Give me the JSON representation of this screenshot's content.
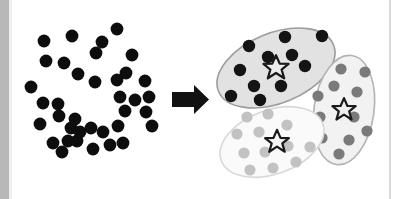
{
  "figure": {
    "title": "Clustering illustration: unlabeled point cloud transformed into three labeled clusters with centroids",
    "width": 397,
    "height": 199,
    "background_color": "#ffffff"
  },
  "chart_data": {
    "type": "scatter",
    "title": "Clustering illustration: unlabeled point cloud transformed into three labeled clusters with centroids",
    "subtitle": "",
    "xlabel": "",
    "ylabel": "",
    "xlim": [
      0,
      397
    ],
    "ylim": [
      0,
      199
    ],
    "grid": false,
    "legend_position": "none",
    "annotations": [
      {
        "name": "transformation-arrow",
        "text": "",
        "shape": "right-arrow",
        "color": "#111111",
        "x": 172,
        "y": 99
      }
    ],
    "series": [
      {
        "name": "Unlabeled points",
        "marker": "circle",
        "color": "#0d0d0d",
        "marker_size": 6.4,
        "points": [
          [
            44,
            41
          ],
          [
            72,
            36
          ],
          [
            46,
            61
          ],
          [
            64,
            63
          ],
          [
            78,
            74
          ],
          [
            96,
            53
          ],
          [
            95,
            82
          ],
          [
            31,
            87
          ],
          [
            117,
            29
          ],
          [
            102,
            42
          ],
          [
            132,
            55
          ],
          [
            126,
            73
          ],
          [
            117,
            80
          ],
          [
            145,
            81
          ],
          [
            43,
            103
          ],
          [
            58,
            104
          ],
          [
            59,
            116
          ],
          [
            75,
            119
          ],
          [
            40,
            124
          ],
          [
            71,
            128
          ],
          [
            80,
            132
          ],
          [
            91,
            128
          ],
          [
            53,
            143
          ],
          [
            68,
            141
          ],
          [
            77,
            141
          ],
          [
            93,
            149
          ],
          [
            62,
            152
          ],
          [
            120,
            97
          ],
          [
            135,
            100
          ],
          [
            149,
            97
          ],
          [
            125,
            111
          ],
          [
            146,
            112
          ],
          [
            118,
            126
          ],
          [
            103,
            132
          ],
          [
            110,
            145
          ],
          [
            123,
            143
          ],
          [
            152,
            126
          ]
        ]
      },
      {
        "name": "Cluster 1 points",
        "marker": "circle",
        "color": "#141414",
        "marker_size": 6.2,
        "points": [
          [
            249,
            46
          ],
          [
            285,
            37
          ],
          [
            322,
            36
          ],
          [
            240,
            70
          ],
          [
            268,
            57
          ],
          [
            292,
            55
          ],
          [
            305,
            66
          ],
          [
            254,
            86
          ],
          [
            281,
            86
          ],
          [
            231,
            96
          ],
          [
            260,
            100
          ]
        ]
      },
      {
        "name": "Cluster 2 points",
        "marker": "circle",
        "color": "#7a7a7a",
        "marker_size": 5.6,
        "points": [
          [
            341,
            69
          ],
          [
            334,
            86
          ],
          [
            318,
            96
          ],
          [
            357,
            92
          ],
          [
            320,
            117
          ],
          [
            354,
            117
          ],
          [
            322,
            138
          ],
          [
            349,
            140
          ],
          [
            339,
            154
          ],
          [
            365,
            72
          ],
          [
            367,
            131
          ]
        ]
      },
      {
        "name": "Cluster 3 points",
        "marker": "circle",
        "color": "#c2c2c2",
        "marker_size": 5.6,
        "points": [
          [
            247,
            117
          ],
          [
            268,
            114
          ],
          [
            237,
            134
          ],
          [
            259,
            132
          ],
          [
            287,
            125
          ],
          [
            288,
            146
          ],
          [
            265,
            152
          ],
          [
            244,
            153
          ],
          [
            273,
            168
          ],
          [
            296,
            162
          ],
          [
            250,
            170
          ],
          [
            310,
            147
          ]
        ]
      },
      {
        "name": "Cluster centroids",
        "marker": "star",
        "color": "#e8e8e8",
        "edge_color": "#1a1a1a",
        "marker_size": 15,
        "points": [
          [
            276,
            68
          ],
          [
            344,
            110
          ],
          [
            277,
            142
          ]
        ]
      }
    ],
    "clusters": [
      {
        "id": 1,
        "label": "Cluster 1",
        "fill_color": "#e2e2e2",
        "stroke_color": "#9c9c9c",
        "point_color": "#141414",
        "centroid": [
          276,
          68
        ],
        "ellipse": {
          "cx": 276,
          "cy": 68,
          "rx": 62,
          "ry": 35,
          "rotation": -22
        },
        "point_count": 11
      },
      {
        "id": 2,
        "label": "Cluster 2",
        "fill_color": "#f2f2f2",
        "stroke_color": "#b4b4b4",
        "point_color": "#7a7a7a",
        "centroid": [
          344,
          110
        ],
        "ellipse": {
          "cx": 344,
          "cy": 110,
          "rx": 30,
          "ry": 55,
          "rotation": 8
        },
        "point_count": 11
      },
      {
        "id": 3,
        "label": "Cluster 3",
        "fill_color": "#fafafa",
        "stroke_color": "#d8d8d8",
        "point_color": "#c2c2c2",
        "centroid": [
          277,
          142
        ],
        "ellipse": {
          "cx": 272,
          "cy": 142,
          "rx": 54,
          "ry": 32,
          "rotation": -20
        },
        "point_count": 12
      }
    ]
  },
  "decor": {
    "left_gutter_color": "#b8b8b8",
    "left_gutter_width": 9,
    "right_rule_color": "#d9d9d9",
    "right_rule_x": 390,
    "canvas_color": "#ffffff"
  }
}
